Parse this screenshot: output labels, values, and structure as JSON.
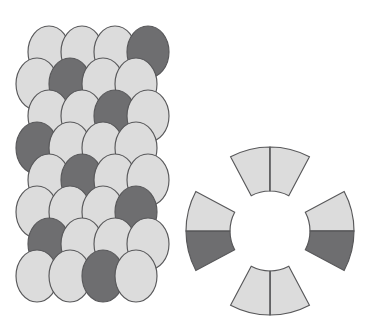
{
  "figure": {
    "background_color": "#ffffff",
    "width": 366,
    "height": 327
  },
  "colors": {
    "light_gray": "#dcdcdc",
    "dark_gray": "#6e6e70",
    "outline": "#58585a",
    "background": "#ffffff"
  },
  "egg_panel": {
    "name": "egg-tessellation",
    "description": "Staggered overlapping oval eggs in 8 rows of 4",
    "rows": 8,
    "columns": 4,
    "egg_width": 42,
    "egg_height": 52,
    "col_spacing": 33,
    "row_spacing": 32,
    "origin_x": 16,
    "origin_y": 26,
    "row_offsets": [
      12,
      0,
      12,
      0,
      12,
      0,
      12,
      0
    ],
    "shades": [
      [
        "light",
        "light",
        "light",
        "dark"
      ],
      [
        "light",
        "dark",
        "light",
        "light"
      ],
      [
        "light",
        "light",
        "dark",
        "light"
      ],
      [
        "dark",
        "light",
        "light",
        "light"
      ],
      [
        "light",
        "dark",
        "light",
        "light"
      ],
      [
        "light",
        "light",
        "light",
        "dark"
      ],
      [
        "dark",
        "light",
        "light",
        "light"
      ],
      [
        "light",
        "light",
        "dark",
        "light"
      ]
    ]
  },
  "ring_panel": {
    "name": "ring-segment-diagram",
    "description": "Four annular sector segments arranged around an empty center",
    "center_x": 270,
    "center_y": 231,
    "inner_radius": 40,
    "outer_radius": 84,
    "sector_span_degrees": 56,
    "segments": [
      {
        "name": "ring-segment-top",
        "position": "top",
        "center_angle_degrees": 270,
        "split": "vertical",
        "halves": [
          {
            "side": "left",
            "shade": "light"
          },
          {
            "side": "right",
            "shade": "light"
          }
        ]
      },
      {
        "name": "ring-segment-right",
        "position": "right",
        "center_angle_degrees": 0,
        "split": "horizontal",
        "halves": [
          {
            "side": "top",
            "shade": "light"
          },
          {
            "side": "bottom",
            "shade": "dark"
          }
        ]
      },
      {
        "name": "ring-segment-bottom",
        "position": "bottom",
        "center_angle_degrees": 90,
        "split": "vertical",
        "halves": [
          {
            "side": "left",
            "shade": "light"
          },
          {
            "side": "right",
            "shade": "light"
          }
        ]
      },
      {
        "name": "ring-segment-left",
        "position": "left",
        "center_angle_degrees": 180,
        "split": "horizontal",
        "halves": [
          {
            "side": "top",
            "shade": "dark"
          },
          {
            "side": "bottom",
            "shade": "light"
          }
        ]
      }
    ]
  }
}
